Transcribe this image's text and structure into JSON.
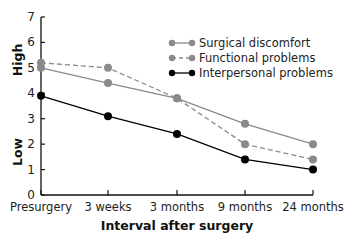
{
  "chart_data": {
    "type": "line",
    "title": "",
    "xlabel": "Interval after surgery",
    "ylabel": "",
    "ylabel_high": "High",
    "ylabel_low": "Low",
    "ylim": [
      0,
      7
    ],
    "yticks": [
      0,
      1,
      2,
      3,
      4,
      5,
      6,
      7
    ],
    "grid": false,
    "legend_position": "upper right",
    "categories": [
      "Presurgery",
      "3 weeks",
      "3 months",
      "9 months",
      "24 months"
    ],
    "series": [
      {
        "name": "Surgical discomfort",
        "style": "solid",
        "color": "#8a8a8a",
        "values": [
          5.0,
          4.4,
          3.8,
          2.8,
          2.0
        ]
      },
      {
        "name": "Functional problems",
        "style": "dashed",
        "color": "#8a8a8a",
        "values": [
          5.2,
          5.0,
          3.8,
          2.0,
          1.4
        ]
      },
      {
        "name": "Interpersonal problems",
        "style": "solid",
        "color": "#000000",
        "values": [
          3.9,
          3.1,
          2.4,
          1.4,
          1.0
        ]
      }
    ]
  }
}
